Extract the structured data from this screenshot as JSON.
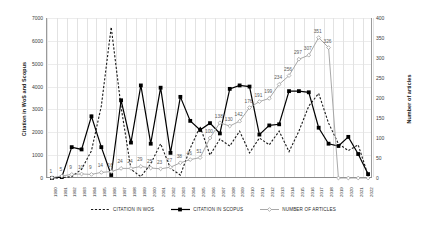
{
  "chart_data": {
    "type": "line",
    "title": "",
    "xlabel": "",
    "ylabel": "Citation in WoS and Scopus",
    "y2label": "Number of articles",
    "ylim": [
      0,
      7000
    ],
    "y2lim": [
      0,
      400
    ],
    "ytick_labels": [
      "0",
      "1000",
      "2000",
      "3000",
      "4000",
      "5000",
      "6000",
      "7000"
    ],
    "ytick_values": [
      0,
      1000,
      2000,
      3000,
      4000,
      5000,
      6000,
      7000
    ],
    "y2tick_labels": [
      "0",
      "50",
      "100",
      "150",
      "200",
      "250",
      "300",
      "350",
      "400"
    ],
    "y2tick_values": [
      0,
      50,
      100,
      150,
      200,
      250,
      300,
      350,
      400
    ],
    "grid": true,
    "legend_position": "bottom",
    "categories": [
      "1990",
      "1991",
      "1992",
      "1993",
      "1994",
      "1995",
      "1996",
      "1997",
      "1998",
      "1999",
      "2000",
      "2001",
      "2002",
      "2003",
      "2004",
      "2005",
      "2006",
      "2007",
      "2008",
      "2009",
      "2010",
      "2011",
      "2012",
      "2013",
      "2014",
      "2015",
      "2016",
      "2017",
      "2018",
      "2019",
      "2020",
      "2021",
      "2022"
    ],
    "series": [
      {
        "name": "CITATION IN WOS",
        "axis": "left",
        "style": "dashed",
        "color": "#1a1a1a",
        "values": [
          0,
          10,
          60,
          380,
          1190,
          3150,
          6600,
          3100,
          380,
          60,
          620,
          1500,
          420,
          130,
          1300,
          2250,
          1000,
          1700,
          1400,
          2050,
          1100,
          1750,
          1450,
          2050,
          1150,
          2050,
          3150,
          3700,
          2400,
          1500,
          1200,
          1450,
          120
        ]
      },
      {
        "name": "CITATION IN SCOPUS",
        "axis": "left",
        "style": "solid",
        "color": "#000000",
        "values": [
          0,
          40,
          1350,
          1250,
          2700,
          1350,
          130,
          3400,
          1550,
          4050,
          1500,
          3950,
          1100,
          3550,
          2500,
          2100,
          2400,
          1950,
          3900,
          4050,
          4000,
          1900,
          2300,
          2350,
          3800,
          3800,
          3750,
          2200,
          1500,
          1400,
          1800,
          1050,
          170
        ]
      },
      {
        "name": "NUMBER OF ARTICLES",
        "axis": "right",
        "style": "solid-gray",
        "color": "#9e9e9e",
        "values": [
          1,
          5,
          9,
          10,
          9,
          14,
          16,
          24,
          24,
          29,
          25,
          23,
          27,
          38,
          46,
          51,
          100,
          138,
          130,
          142,
          176,
          191,
          199,
          234,
          256,
          297,
          307,
          351,
          326,
          0,
          0,
          0,
          0
        ],
        "labels": [
          "1",
          "5",
          "9",
          "10",
          "9",
          "14",
          "16",
          "24",
          "24",
          "29",
          "25",
          "23",
          "27",
          "38",
          "46",
          "51",
          "100",
          "138",
          "130",
          "142",
          "176",
          "191",
          "199",
          "234",
          "256",
          "297",
          "307",
          "351",
          "326",
          "",
          "",
          "",
          ""
        ]
      }
    ]
  },
  "legend": {
    "items": [
      {
        "label": "CITATION IN WOS",
        "key": "dashed-line-key"
      },
      {
        "label": "CITATION IN SCOPUS",
        "key": "solid-square-line-key"
      },
      {
        "label": "NUMBER OF ARTICLES",
        "key": "gray-diamond-line-key"
      }
    ]
  }
}
